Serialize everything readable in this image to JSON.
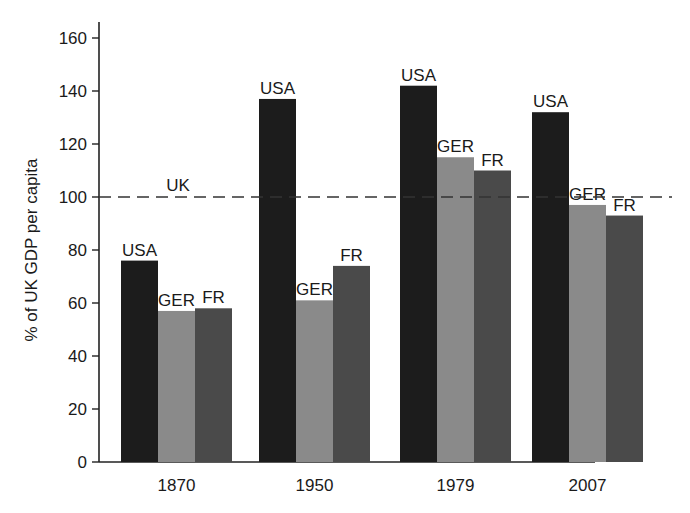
{
  "chart_data": {
    "type": "bar",
    "title": "",
    "xlabel": "",
    "ylabel": "% of UK GDP per capita",
    "ylim": [
      0,
      160
    ],
    "yticks": [
      0,
      20,
      40,
      60,
      80,
      100,
      120,
      140,
      160
    ],
    "grid": false,
    "legend": "none (bars labeled directly)",
    "categories": [
      "1870",
      "1950",
      "1979",
      "2007"
    ],
    "series": [
      {
        "name": "USA",
        "color": "#1c1c1c",
        "values": [
          76,
          137,
          142,
          132
        ]
      },
      {
        "name": "GER",
        "color": "#8a8a8a",
        "values": [
          57,
          61,
          115,
          97
        ]
      },
      {
        "name": "FR",
        "color": "#4a4a4a",
        "values": [
          58,
          74,
          110,
          93
        ]
      }
    ],
    "reference_line": {
      "label": "UK",
      "value": 100,
      "style": "dashed"
    }
  }
}
